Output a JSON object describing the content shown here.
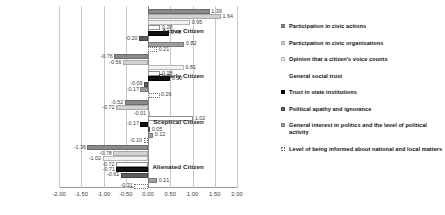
{
  "chart_data": {
    "type": "bar",
    "orientation": "horizontal",
    "title": "",
    "xlabel": "",
    "ylabel": "",
    "xlim": [
      -2.0,
      2.0
    ],
    "xticks": [
      "-2.00",
      "-1.50",
      "-1.00",
      "-0.50",
      "0.00",
      "0.50",
      "1.00",
      "1.50",
      "2.00"
    ],
    "xtick_values": [
      -2.0,
      -1.5,
      -1.0,
      -0.5,
      0.0,
      0.5,
      1.0,
      1.5,
      2.0
    ],
    "grid": true,
    "legend_position": "right",
    "categories": [
      "Active Citizen",
      "Orderly Citizen",
      "Sceptical Citizen",
      "Alienated Citizen"
    ],
    "series": [
      {
        "name": "Participation in civic actions",
        "swatch": "#8a8a8a",
        "values": [
          1.39,
          -0.76,
          -0.52,
          -1.36
        ],
        "labels": [
          "1.39",
          "-0.76",
          "-0.52",
          "-1.36"
        ]
      },
      {
        "name": "Participation in civic organisations",
        "swatch": "#d2d2d2",
        "values": [
          1.64,
          -0.56,
          -0.72,
          -0.78
        ],
        "labels": [
          "1.64",
          "-0.56",
          "-0.72",
          "-0.78"
        ]
      },
      {
        "name": "Opinion that a citizen's voice counts",
        "swatch": "#f2f2f2",
        "values": [
          0.95,
          0.81,
          -0.01,
          -1.02
        ],
        "labels": [
          "0.95",
          "0.81",
          "-0.01",
          "-1.02"
        ]
      },
      {
        "name": "General social trust",
        "swatch": "#ffffff",
        "values": [
          0.28,
          0.28,
          1.02,
          -0.72
        ],
        "labels": [
          "0.28",
          "0.28",
          "1.02",
          "-0.72"
        ]
      },
      {
        "name": "Trust in state institutions",
        "swatch": "#111111",
        "values": [
          0.48,
          0.5,
          -0.17,
          -0.71
        ],
        "labels": [
          "0.48",
          "0.50",
          "-0.17",
          "-0.71"
        ]
      },
      {
        "name": "Political apathy and ignorance",
        "swatch": "#5e5e5e",
        "values": [
          -0.2,
          -0.09,
          0.05,
          -0.61
        ],
        "labels": [
          "-0.20",
          "-0.09",
          "0.05",
          "-0.61"
        ]
      },
      {
        "name": "General interest in politics and the level of political activity",
        "swatch": "#9e9e9e",
        "values": [
          0.82,
          -0.17,
          0.12,
          0.21
        ],
        "labels": [
          "0.82",
          "-0.17",
          "0.12",
          "0.21"
        ]
      },
      {
        "name": "Level of being informed about national and local matters",
        "swatch": "#ffffff",
        "values": [
          0.21,
          0.26,
          -0.1,
          -0.31
        ],
        "labels": [
          "0.21",
          "0.26",
          "-0.10",
          "-0.31"
        ]
      }
    ]
  },
  "legend": {
    "items": [
      "Participation in civic actions",
      "Participation in civic organisations",
      "Opinion that a citizen's voice counts",
      "General social trust",
      "Trust in state institutions",
      "Political apathy and ignorance",
      "General interest in politics and the level of political activity",
      "Level of being informed about national and local matters"
    ]
  }
}
